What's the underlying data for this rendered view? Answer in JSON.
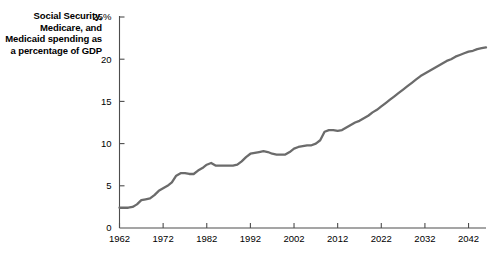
{
  "chart_data": {
    "type": "line",
    "title": "Social Security, Medicare, and Medicaid spending as a percentage of GDP",
    "xlabel": "",
    "ylabel": "",
    "xlim": [
      1962,
      1962
    ],
    "ylim": [
      0,
      25
    ],
    "grid": false,
    "legend": null,
    "line_color": "#6b6b6b",
    "axis_color": "#4d4d4d",
    "x_tick_labels": [
      "1962",
      "1972",
      "1982",
      "1992",
      "2002",
      "2012",
      "2022",
      "2032",
      "2042"
    ],
    "x_tick_values": [
      1962,
      1972,
      1982,
      1992,
      2002,
      2012,
      2022,
      2032,
      2042
    ],
    "y_tick_labels": [
      "0",
      "5",
      "10",
      "15",
      "20",
      "25%"
    ],
    "y_tick_values": [
      0,
      5,
      10,
      15,
      20,
      25
    ],
    "x": [
      1962,
      1963,
      1964,
      1965,
      1966,
      1967,
      1968,
      1969,
      1970,
      1971,
      1972,
      1973,
      1974,
      1975,
      1976,
      1977,
      1978,
      1979,
      1980,
      1981,
      1982,
      1983,
      1984,
      1985,
      1986,
      1987,
      1988,
      1989,
      1990,
      1991,
      1992,
      1993,
      1994,
      1995,
      1996,
      1997,
      1998,
      1999,
      2000,
      2001,
      2002,
      2003,
      2004,
      2005,
      2006,
      2007,
      2008,
      2009,
      2010,
      2011,
      2012,
      2013,
      2014,
      2015,
      2016,
      2017,
      2018,
      2019,
      2020,
      2021,
      2022,
      2023,
      2024,
      2025,
      2026,
      2027,
      2028,
      2029,
      2030,
      2031,
      2032,
      2033,
      2034,
      2035,
      2036,
      2037,
      2038,
      2039,
      2040,
      2041,
      2042,
      2043,
      2044,
      2045,
      2046
    ],
    "y": [
      2.4,
      2.4,
      2.4,
      2.5,
      2.8,
      3.3,
      3.4,
      3.5,
      3.9,
      4.4,
      4.7,
      5.0,
      5.4,
      6.2,
      6.5,
      6.5,
      6.4,
      6.4,
      6.8,
      7.1,
      7.5,
      7.7,
      7.4,
      7.4,
      7.4,
      7.4,
      7.4,
      7.5,
      7.9,
      8.4,
      8.8,
      8.9,
      9.0,
      9.1,
      9.0,
      8.8,
      8.7,
      8.7,
      8.7,
      9.0,
      9.4,
      9.6,
      9.7,
      9.8,
      9.8,
      10.0,
      10.4,
      11.4,
      11.6,
      11.6,
      11.5,
      11.6,
      11.9,
      12.2,
      12.5,
      12.7,
      13.0,
      13.3,
      13.7,
      14.0,
      14.4,
      14.8,
      15.2,
      15.6,
      16.0,
      16.4,
      16.8,
      17.2,
      17.6,
      18.0,
      18.3,
      18.6,
      18.9,
      19.2,
      19.5,
      19.8,
      20.0,
      20.3,
      20.5,
      20.7,
      20.9,
      21.0,
      21.2,
      21.3,
      21.4
    ]
  }
}
